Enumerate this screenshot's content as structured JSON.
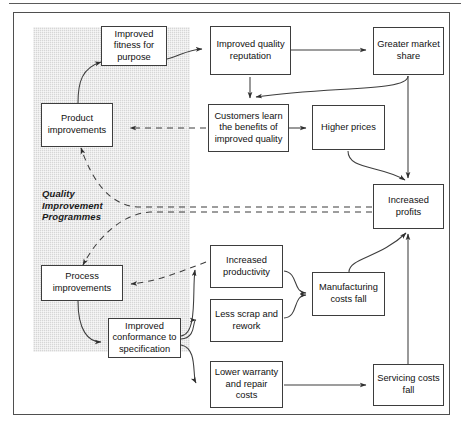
{
  "figure": {
    "type": "flow-diagram",
    "region_label": "Quality Improvement Programmes",
    "shaded_region_name": "quality-improvement-programmes-region"
  },
  "nodes": [
    {
      "id": "improved-fitness-for-purpose",
      "label": "Improved fitness for purpose"
    },
    {
      "id": "product-improvements",
      "label": "Product improvements"
    },
    {
      "id": "process-improvements",
      "label": "Process improvements"
    },
    {
      "id": "improved-conformance-to-specification",
      "label": "Improved conformance to specification"
    },
    {
      "id": "improved-quality-reputation",
      "label": "Improved quality reputation"
    },
    {
      "id": "greater-market-share",
      "label": "Greater market share"
    },
    {
      "id": "customers-learn-the-benefits-of-improved-quality",
      "label": "Customers learn the benefits of improved quality"
    },
    {
      "id": "higher-prices",
      "label": "Higher prices"
    },
    {
      "id": "increased-profits",
      "label": "Increased profits"
    },
    {
      "id": "increased-productivity",
      "label": "Increased productivity"
    },
    {
      "id": "less-scrap-and-rework",
      "label": "Less scrap and rework"
    },
    {
      "id": "manufacturing-costs-fall",
      "label": "Manufacturing costs fall"
    },
    {
      "id": "lower-warranty-and-repair-costs",
      "label": "Lower warranty and repair costs"
    },
    {
      "id": "servicing-costs-fall",
      "label": "Servicing costs fall"
    }
  ],
  "edges": [
    {
      "from": "product-improvements",
      "to": "improved-fitness-for-purpose",
      "style": "solid"
    },
    {
      "from": "improved-fitness-for-purpose",
      "to": "improved-quality-reputation",
      "style": "solid"
    },
    {
      "from": "improved-quality-reputation",
      "to": "greater-market-share",
      "style": "solid"
    },
    {
      "from": "improved-quality-reputation",
      "to": "customers-learn-the-benefits-of-improved-quality",
      "style": "solid"
    },
    {
      "from": "greater-market-share",
      "to": "customers-learn-the-benefits-of-improved-quality",
      "style": "solid"
    },
    {
      "from": "greater-market-share",
      "to": "increased-profits",
      "style": "solid"
    },
    {
      "from": "customers-learn-the-benefits-of-improved-quality",
      "to": "higher-prices",
      "style": "solid"
    },
    {
      "from": "customers-learn-the-benefits-of-improved-quality",
      "to": "product-improvements",
      "style": "dashed"
    },
    {
      "from": "higher-prices",
      "to": "increased-profits",
      "style": "solid"
    },
    {
      "from": "increased-profits",
      "to": "product-improvements",
      "style": "dashed"
    },
    {
      "from": "increased-profits",
      "to": "process-improvements",
      "style": "dashed"
    },
    {
      "from": "increased-productivity",
      "to": "process-improvements",
      "style": "dashed"
    },
    {
      "from": "process-improvements",
      "to": "improved-conformance-to-specification",
      "style": "solid"
    },
    {
      "from": "improved-conformance-to-specification",
      "to": "increased-productivity",
      "style": "solid"
    },
    {
      "from": "improved-conformance-to-specification",
      "to": "less-scrap-and-rework",
      "style": "solid"
    },
    {
      "from": "improved-conformance-to-specification",
      "to": "lower-warranty-and-repair-costs",
      "style": "solid"
    },
    {
      "from": "increased-productivity",
      "to": "manufacturing-costs-fall",
      "style": "solid"
    },
    {
      "from": "less-scrap-and-rework",
      "to": "manufacturing-costs-fall",
      "style": "solid"
    },
    {
      "from": "manufacturing-costs-fall",
      "to": "increased-profits",
      "style": "solid"
    },
    {
      "from": "lower-warranty-and-repair-costs",
      "to": "servicing-costs-fall",
      "style": "solid"
    },
    {
      "from": "servicing-costs-fall",
      "to": "increased-profits",
      "style": "solid"
    }
  ],
  "colors": {
    "frame": "#4f4f4f",
    "box_border": "#3d3d3d",
    "shade": "#d6d6d6",
    "text": "#111111",
    "connector": "#3d3d3d"
  }
}
